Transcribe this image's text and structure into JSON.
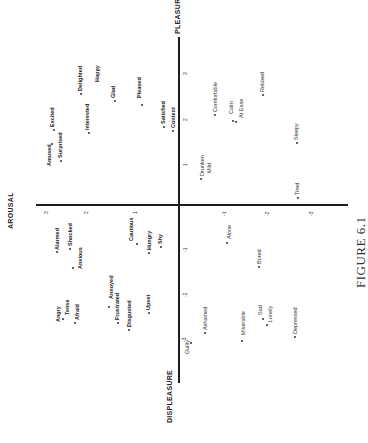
{
  "figure": {
    "caption": "FIGURE 6.1",
    "rotation_deg": -90,
    "axes": {
      "arousal_label": "AROUSAL",
      "pleasure_label": "PLEASURE",
      "displeasure_label": "DISPLEASURE"
    },
    "layout": {
      "h_axis": {
        "x1": 36,
        "x2": 348,
        "y": 205
      },
      "v_axis": {
        "x": 179,
        "y1": 37,
        "y2": 383
      },
      "arousal_title_pos": {
        "x": 7,
        "y": 229
      },
      "pleasure_title_pos": {
        "x": 174,
        "y": 34
      },
      "displeasure_title_pos": {
        "x": 166,
        "y": 423
      },
      "caption_pos": {
        "x": 353,
        "y": 288
      }
    },
    "ticks": [
      {
        "text": "3",
        "x": 43,
        "y": 214,
        "axis": "arousal"
      },
      {
        "text": "2",
        "x": 83,
        "y": 214,
        "axis": "arousal"
      },
      {
        "text": "1",
        "x": 132,
        "y": 214,
        "axis": "arousal"
      },
      {
        "text": "-1",
        "x": 221,
        "y": 216,
        "axis": "arousal"
      },
      {
        "text": "-2",
        "x": 264,
        "y": 216,
        "axis": "arousal"
      },
      {
        "text": "-3",
        "x": 308,
        "y": 216,
        "axis": "arousal"
      },
      {
        "text": "3",
        "x": 182,
        "y": 75,
        "axis": "pleasure"
      },
      {
        "text": "2",
        "x": 182,
        "y": 121,
        "axis": "pleasure"
      },
      {
        "text": "1",
        "x": 182,
        "y": 166,
        "axis": "pleasure"
      },
      {
        "text": "-1",
        "x": 182,
        "y": 252,
        "axis": "pleasure"
      },
      {
        "text": "-2",
        "x": 182,
        "y": 297,
        "axis": "pleasure"
      },
      {
        "text": "-3",
        "x": 181,
        "y": 342,
        "axis": "pleasure"
      }
    ],
    "words": [
      {
        "text": "Excited",
        "x": 49,
        "y": 127,
        "bold": true,
        "dot": {
          "x": 53,
          "y": 129
        }
      },
      {
        "text": "Amused",
        "x": 46,
        "y": 166,
        "bold": true,
        "dot": {
          "x": 51,
          "y": 143
        }
      },
      {
        "text": "Surprised",
        "x": 57,
        "y": 158,
        "bold": true,
        "dot": {
          "x": 60,
          "y": 160
        }
      },
      {
        "text": "Delighted",
        "x": 77,
        "y": 91,
        "bold": true,
        "dot": {
          "x": 80,
          "y": 93
        }
      },
      {
        "text": "Happy",
        "x": 94,
        "y": 82,
        "bold": true,
        "dot": null
      },
      {
        "text": "Interested",
        "x": 84,
        "y": 130,
        "bold": true,
        "dot": {
          "x": 88,
          "y": 132
        }
      },
      {
        "text": "Glad",
        "x": 110,
        "y": 98,
        "bold": true,
        "dot": {
          "x": 114,
          "y": 100
        }
      },
      {
        "text": "Pleased",
        "x": 136,
        "y": 98,
        "bold": true,
        "dot": {
          "x": 141,
          "y": 104
        }
      },
      {
        "text": "Satisfied",
        "x": 160,
        "y": 124,
        "bold": true,
        "dot": {
          "x": 163,
          "y": 126
        }
      },
      {
        "text": "Content",
        "x": 170,
        "y": 128,
        "bold": true,
        "dot": {
          "x": 172,
          "y": 130
        }
      },
      {
        "text": "Comfortable",
        "x": 212,
        "y": 112,
        "bold": false,
        "dot": {
          "x": 214,
          "y": 114
        }
      },
      {
        "text": "Calm",
        "x": 228,
        "y": 114,
        "bold": false,
        "dot": {
          "x": 232,
          "y": 120
        }
      },
      {
        "text": "At Ease",
        "x": 238,
        "y": 118,
        "bold": false,
        "dot": {
          "x": 235,
          "y": 121
        }
      },
      {
        "text": "Relaxed",
        "x": 259,
        "y": 92,
        "bold": false,
        "dot": {
          "x": 262,
          "y": 94
        }
      },
      {
        "text": "Drunken",
        "x": 199,
        "y": 176,
        "bold": false,
        "dot": {
          "x": 200,
          "y": 178
        }
      },
      {
        "text": "Mild",
        "x": 206,
        "y": 173,
        "bold": false,
        "dot": null
      },
      {
        "text": "Sleepy",
        "x": 293,
        "y": 140,
        "bold": false,
        "dot": {
          "x": 296,
          "y": 142
        }
      },
      {
        "text": "Tired",
        "x": 294,
        "y": 195,
        "bold": false,
        "dot": {
          "x": 297,
          "y": 197
        }
      },
      {
        "text": "Alarmed",
        "x": 54,
        "y": 250,
        "bold": true,
        "dot": {
          "x": 56,
          "y": 251
        }
      },
      {
        "text": "Shocked",
        "x": 67,
        "y": 246,
        "bold": true,
        "dot": {
          "x": 69,
          "y": 248
        }
      },
      {
        "text": "Anxious",
        "x": 77,
        "y": 269,
        "bold": true,
        "dot": {
          "x": 72,
          "y": 267
        }
      },
      {
        "text": "Cautious",
        "x": 128,
        "y": 241,
        "bold": true,
        "dot": {
          "x": 136,
          "y": 243
        }
      },
      {
        "text": "Hungry",
        "x": 146,
        "y": 250,
        "bold": true,
        "dot": {
          "x": 148,
          "y": 252
        }
      },
      {
        "text": "Shy",
        "x": 157,
        "y": 244,
        "bold": true,
        "dot": {
          "x": 160,
          "y": 246
        }
      },
      {
        "text": "Alone",
        "x": 226,
        "y": 239,
        "bold": false,
        "dot": {
          "x": 226,
          "y": 242
        }
      },
      {
        "text": "Bored",
        "x": 256,
        "y": 264,
        "bold": false,
        "dot": {
          "x": 258,
          "y": 266
        }
      },
      {
        "text": "Angry",
        "x": 55,
        "y": 322,
        "bold": true,
        "dot": null
      },
      {
        "text": "Tense",
        "x": 64,
        "y": 315,
        "bold": true,
        "dot": {
          "x": 62,
          "y": 318
        }
      },
      {
        "text": "Afraid",
        "x": 74,
        "y": 320,
        "bold": true,
        "dot": {
          "x": 74,
          "y": 322
        }
      },
      {
        "text": "Annoyed",
        "x": 108,
        "y": 299,
        "bold": true,
        "dot": {
          "x": 108,
          "y": 306
        }
      },
      {
        "text": "Frustrated",
        "x": 114,
        "y": 320,
        "bold": true,
        "dot": {
          "x": 117,
          "y": 322
        }
      },
      {
        "text": "Disgusted",
        "x": 126,
        "y": 327,
        "bold": true,
        "dot": {
          "x": 128,
          "y": 329
        }
      },
      {
        "text": "Upset",
        "x": 145,
        "y": 310,
        "bold": true,
        "dot": {
          "x": 148,
          "y": 312
        }
      },
      {
        "text": "Guilty",
        "x": 184,
        "y": 354,
        "bold": false,
        "dot": {
          "x": 190,
          "y": 342
        }
      },
      {
        "text": "Ashamed",
        "x": 202,
        "y": 330,
        "bold": false,
        "dot": {
          "x": 204,
          "y": 332
        }
      },
      {
        "text": "Miserable",
        "x": 240,
        "y": 335,
        "bold": false,
        "dot": {
          "x": 241,
          "y": 340
        }
      },
      {
        "text": "Sad",
        "x": 257,
        "y": 315,
        "bold": false,
        "dot": {
          "x": 262,
          "y": 318
        }
      },
      {
        "text": "Lonely",
        "x": 267,
        "y": 322,
        "bold": false,
        "dot": {
          "x": 266,
          "y": 324
        }
      },
      {
        "text": "Depressed",
        "x": 292,
        "y": 334,
        "bold": false,
        "dot": {
          "x": 294,
          "y": 336
        }
      }
    ]
  },
  "chart_data": {
    "type": "scatter",
    "title": "FIGURE 6.1",
    "note": "Circumplex of emotion words; figure printed rotated 90 degrees counter-clockwise",
    "xlabel": "AROUSAL",
    "ylabel": "PLEASURE / DISPLEASURE",
    "xlim": [
      -3,
      3
    ],
    "ylim": [
      -3,
      3
    ],
    "grid": false,
    "x_ticks": [
      -3,
      -2,
      -1,
      1,
      2,
      3
    ],
    "y_ticks": [
      -3,
      -2,
      -1,
      1,
      2,
      3
    ],
    "points": [
      {
        "label": "Excited",
        "arousal": 3.0,
        "pleasure": 1.7
      },
      {
        "label": "Amused",
        "arousal": 3.0,
        "pleasure": 1.4
      },
      {
        "label": "Surprised",
        "arousal": 2.9,
        "pleasure": 1.0
      },
      {
        "label": "Delighted",
        "arousal": 2.3,
        "pleasure": 2.5
      },
      {
        "label": "Happy",
        "arousal": 2.0,
        "pleasure": 2.6
      },
      {
        "label": "Interested",
        "arousal": 2.2,
        "pleasure": 1.6
      },
      {
        "label": "Glad",
        "arousal": 1.6,
        "pleasure": 2.3
      },
      {
        "label": "Pleased",
        "arousal": 0.9,
        "pleasure": 2.2
      },
      {
        "label": "Satisfied",
        "arousal": 0.4,
        "pleasure": 1.7
      },
      {
        "label": "Content",
        "arousal": 0.2,
        "pleasure": 1.7
      },
      {
        "label": "Comfortable",
        "arousal": -0.8,
        "pleasure": 2.0
      },
      {
        "label": "Calm",
        "arousal": -1.2,
        "pleasure": 1.9
      },
      {
        "label": "At Ease",
        "arousal": -1.3,
        "pleasure": 1.9
      },
      {
        "label": "Relaxed",
        "arousal": -1.8,
        "pleasure": 2.5
      },
      {
        "label": "Drunken",
        "arousal": -0.5,
        "pleasure": 0.6
      },
      {
        "label": "Mild",
        "arousal": -0.6,
        "pleasure": 0.6
      },
      {
        "label": "Sleepy",
        "arousal": -2.7,
        "pleasure": 1.4
      },
      {
        "label": "Tired",
        "arousal": -2.7,
        "pleasure": 0.2
      },
      {
        "label": "Alarmed",
        "arousal": 2.8,
        "pleasure": -1.0
      },
      {
        "label": "Shocked",
        "arousal": 2.5,
        "pleasure": -1.0
      },
      {
        "label": "Anxious",
        "arousal": 2.4,
        "pleasure": -1.4
      },
      {
        "label": "Cautious",
        "arousal": 1.0,
        "pleasure": -0.8
      },
      {
        "label": "Hungry",
        "arousal": 0.7,
        "pleasure": -1.0
      },
      {
        "label": "Shy",
        "arousal": 0.4,
        "pleasure": -0.9
      },
      {
        "label": "Alone",
        "arousal": -1.1,
        "pleasure": -0.8
      },
      {
        "label": "Bored",
        "arousal": -1.8,
        "pleasure": -1.4
      },
      {
        "label": "Angry",
        "arousal": 2.8,
        "pleasure": -2.6
      },
      {
        "label": "Tense",
        "arousal": 2.6,
        "pleasure": -2.5
      },
      {
        "label": "Afraid",
        "arousal": 2.3,
        "pleasure": -2.6
      },
      {
        "label": "Annoyed",
        "arousal": 1.6,
        "pleasure": -2.2
      },
      {
        "label": "Frustrated",
        "arousal": 1.5,
        "pleasure": -2.6
      },
      {
        "label": "Disgusted",
        "arousal": 1.2,
        "pleasure": -2.8
      },
      {
        "label": "Upset",
        "arousal": 0.7,
        "pleasure": -2.3
      },
      {
        "label": "Guilty",
        "arousal": -0.2,
        "pleasure": -3.0
      },
      {
        "label": "Ashamed",
        "arousal": -0.6,
        "pleasure": -2.8
      },
      {
        "label": "Miserable",
        "arousal": -1.4,
        "pleasure": -3.0
      },
      {
        "label": "Sad",
        "arousal": -1.8,
        "pleasure": -2.5
      },
      {
        "label": "Lonely",
        "arousal": -2.0,
        "pleasure": -2.6
      },
      {
        "label": "Depressed",
        "arousal": -2.6,
        "pleasure": -2.9
      }
    ]
  }
}
